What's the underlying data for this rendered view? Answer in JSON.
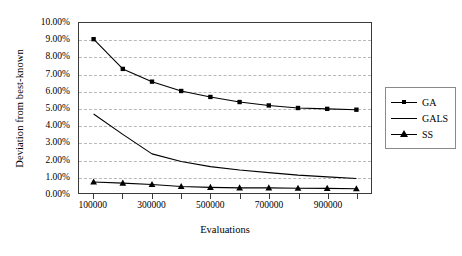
{
  "chart_data": {
    "type": "line",
    "title": "",
    "xlabel": "Evaluations",
    "ylabel": "Deviation from best-known",
    "x": [
      100000,
      200000,
      300000,
      400000,
      500000,
      600000,
      700000,
      800000,
      900000,
      1000000
    ],
    "xlim": [
      50000,
      1050000
    ],
    "ylim": [
      0,
      0.1
    ],
    "grid": true,
    "legend_position": "right",
    "y_tick_labels": [
      "10.00%",
      "9.00%",
      "8.00%",
      "7.00%",
      "6.00%",
      "5.00%",
      "4.00%",
      "3.00%",
      "2.00%",
      "1.00%",
      "0.00%"
    ],
    "y_tick_values": [
      0.1,
      0.09,
      0.08,
      0.07,
      0.06,
      0.05,
      0.04,
      0.03,
      0.02,
      0.01,
      0.0
    ],
    "x_tick_values": [
      100000,
      200000,
      300000,
      400000,
      500000,
      600000,
      700000,
      800000,
      900000,
      1000000
    ],
    "x_tick_labels": [
      "100000",
      "",
      "300000",
      "",
      "500000",
      "",
      "700000",
      "",
      "900000",
      ""
    ],
    "series": [
      {
        "name": "GA",
        "marker": "square",
        "color": "#000000",
        "values": [
          9.05,
          7.3,
          6.55,
          6.0,
          5.65,
          5.35,
          5.15,
          5.0,
          4.95,
          4.9
        ]
      },
      {
        "name": "GALS",
        "marker": "none",
        "color": "#000000",
        "values": [
          4.65,
          3.45,
          2.3,
          1.85,
          1.55,
          1.35,
          1.2,
          1.05,
          0.95,
          0.85
        ]
      },
      {
        "name": "SS",
        "marker": "triangle",
        "color": "#000000",
        "values": [
          0.65,
          0.58,
          0.5,
          0.38,
          0.33,
          0.3,
          0.3,
          0.28,
          0.27,
          0.25
        ]
      }
    ]
  },
  "legend": {
    "items": [
      {
        "label": "GA",
        "marker": "square"
      },
      {
        "label": "GALS",
        "marker": "none"
      },
      {
        "label": "SS",
        "marker": "triangle"
      }
    ]
  }
}
